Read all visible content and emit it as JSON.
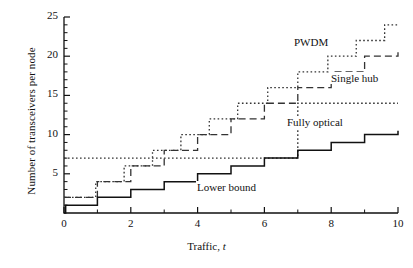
{
  "chart_data": {
    "type": "line",
    "title": "",
    "xlabel": "Traffic, t",
    "ylabel": "Number of transceivers per node",
    "xlim": [
      0,
      10
    ],
    "ylim": [
      0,
      25
    ],
    "xticks": [
      0,
      2,
      4,
      6,
      8,
      10
    ],
    "xtick_labels": [
      "0",
      "2",
      "4",
      "6",
      "8",
      "10"
    ],
    "xminor_ticks": [
      1,
      3,
      5,
      7,
      9
    ],
    "yticks": [
      5,
      10,
      15,
      20,
      25
    ],
    "ytick_labels": [
      "5",
      "10",
      "15",
      "20",
      "25"
    ],
    "yminor_ticks": [
      1,
      2,
      3,
      4,
      6,
      7,
      8,
      9,
      11,
      12,
      13,
      14,
      16,
      17,
      18,
      19,
      21,
      22,
      23,
      24
    ],
    "grid": false,
    "legend_position": "inline-annotations",
    "series": [
      {
        "name": "PWDM",
        "style": "dotted",
        "color": "#333333",
        "steps": [
          {
            "x": 0.0,
            "y": 2
          },
          {
            "x": 0.95,
            "y": 4
          },
          {
            "x": 1.8,
            "y": 6
          },
          {
            "x": 2.65,
            "y": 8
          },
          {
            "x": 3.5,
            "y": 10
          },
          {
            "x": 4.35,
            "y": 12
          },
          {
            "x": 5.2,
            "y": 14
          },
          {
            "x": 6.1,
            "y": 16
          },
          {
            "x": 7.0,
            "y": 18
          },
          {
            "x": 7.9,
            "y": 20
          },
          {
            "x": 8.75,
            "y": 22
          },
          {
            "x": 9.6,
            "y": 24
          },
          {
            "x": 10.0,
            "y": 24
          }
        ]
      },
      {
        "name": "Single hub",
        "style": "dashed",
        "color": "#333333",
        "steps": [
          {
            "x": 0.0,
            "y": 2
          },
          {
            "x": 1.0,
            "y": 4
          },
          {
            "x": 2.0,
            "y": 6
          },
          {
            "x": 3.0,
            "y": 8
          },
          {
            "x": 4.0,
            "y": 10
          },
          {
            "x": 5.0,
            "y": 12
          },
          {
            "x": 6.0,
            "y": 14
          },
          {
            "x": 7.0,
            "y": 16
          },
          {
            "x": 8.0,
            "y": 18
          },
          {
            "x": 9.0,
            "y": 20
          },
          {
            "x": 10.0,
            "y": 20.5
          }
        ]
      },
      {
        "name": "Fully optical",
        "style": "dotted",
        "color": "#333333",
        "steps": [
          {
            "x": 0.0,
            "y": 7
          },
          {
            "x": 7.0,
            "y": 7
          },
          {
            "x": 7.0,
            "y": 14
          },
          {
            "x": 10.0,
            "y": 14
          }
        ]
      },
      {
        "name": "Lower bound",
        "style": "solid",
        "color": "#111111",
        "steps": [
          {
            "x": 0.0,
            "y": 0
          },
          {
            "x": 0.05,
            "y": 1
          },
          {
            "x": 1.0,
            "y": 2
          },
          {
            "x": 2.0,
            "y": 3
          },
          {
            "x": 3.0,
            "y": 4
          },
          {
            "x": 4.0,
            "y": 5
          },
          {
            "x": 5.0,
            "y": 6
          },
          {
            "x": 6.0,
            "y": 7
          },
          {
            "x": 7.0,
            "y": 8
          },
          {
            "x": 8.0,
            "y": 9
          },
          {
            "x": 9.0,
            "y": 10
          },
          {
            "x": 10.0,
            "y": 10.5
          }
        ]
      }
    ],
    "annotations": [
      {
        "text": "PWDM",
        "x_px": 293,
        "y_px": 36
      },
      {
        "text": "Single hub",
        "x_px": 330,
        "y_px": 72
      },
      {
        "text": "Fully optical",
        "x_px": 286,
        "y_px": 116
      },
      {
        "text": "Lower bound",
        "x_px": 196,
        "y_px": 181
      }
    ]
  }
}
